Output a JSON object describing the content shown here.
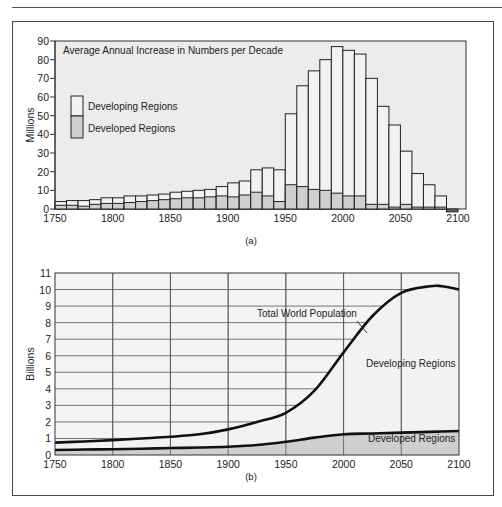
{
  "figure": {
    "panel_a_caption": "(a)",
    "panel_b_caption": "(b)"
  },
  "colors": {
    "plot_bg": "#ececec",
    "developing_fill": "#f2f2f2",
    "developed_fill": "#cfcfcf",
    "outline": "#222222",
    "grid": "#555555"
  },
  "chart_data": [
    {
      "type": "bar",
      "stacked": true,
      "title": "Average Annual Increase in Numbers per Decade",
      "xlabel": "",
      "ylabel": "Millions",
      "xlim": [
        1750,
        2100
      ],
      "ylim": [
        0,
        90
      ],
      "xticks": [
        1750,
        1800,
        1850,
        1900,
        1950,
        2000,
        2050,
        2100
      ],
      "yticks": [
        0,
        10,
        20,
        30,
        40,
        50,
        60,
        70,
        80,
        90
      ],
      "grid": false,
      "legend": {
        "position": "upper-left",
        "entries": [
          "Developing Regions",
          "Developed Regions"
        ]
      },
      "categories": [
        1750,
        1760,
        1770,
        1780,
        1790,
        1800,
        1810,
        1820,
        1830,
        1840,
        1850,
        1860,
        1870,
        1880,
        1890,
        1900,
        1910,
        1920,
        1930,
        1940,
        1950,
        1960,
        1970,
        1980,
        1990,
        2000,
        2010,
        2020,
        2030,
        2040,
        2050,
        2060,
        2070,
        2080,
        2090
      ],
      "series": [
        {
          "name": "Developed Regions",
          "values": [
            2,
            2,
            1.5,
            2.5,
            3,
            3,
            3.5,
            4,
            4.5,
            5,
            5.5,
            6,
            6,
            6.5,
            7,
            6.5,
            7.5,
            9,
            7,
            4,
            13,
            12,
            10.5,
            10,
            8.5,
            7,
            7,
            2.5,
            2.5,
            1,
            2.5,
            1,
            1,
            1,
            0
          ]
        },
        {
          "name": "Developing Regions",
          "values": [
            2,
            2.5,
            3,
            2.5,
            3,
            3,
            3.5,
            3,
            3,
            3,
            3.5,
            3.5,
            4,
            4,
            5,
            7.5,
            7.5,
            12,
            15,
            17,
            38,
            54,
            63.5,
            70,
            78.5,
            78,
            76,
            67.5,
            52.5,
            44,
            28.5,
            18,
            12,
            6,
            -1
          ]
        }
      ],
      "totals": [
        4,
        4.5,
        4.5,
        5,
        6,
        6,
        7,
        7,
        7.5,
        8,
        9,
        9.5,
        10,
        10.5,
        12,
        14,
        15,
        21,
        22,
        21,
        51,
        66,
        74,
        80,
        87,
        85,
        83,
        70,
        55,
        45,
        31,
        19,
        13,
        7,
        -1
      ]
    },
    {
      "type": "area",
      "stacked": true,
      "title": "",
      "xlabel": "",
      "ylabel": "Billions",
      "xlim": [
        1750,
        2100
      ],
      "ylim": [
        0,
        11
      ],
      "xticks": [
        1750,
        1800,
        1850,
        1900,
        1950,
        2000,
        2050,
        2100
      ],
      "yticks": [
        0,
        1,
        2,
        3,
        4,
        5,
        6,
        7,
        8,
        9,
        10,
        11
      ],
      "grid": true,
      "annotations": [
        "Total World Population",
        "Developing Regions",
        "Developed Regions"
      ],
      "x": [
        1750,
        1775,
        1800,
        1825,
        1850,
        1875,
        1900,
        1925,
        1950,
        1975,
        2000,
        2025,
        2050,
        2075,
        2085,
        2100
      ],
      "series": [
        {
          "name": "Developed Regions",
          "values": [
            0.3,
            0.33,
            0.35,
            0.38,
            0.42,
            0.45,
            0.5,
            0.6,
            0.8,
            1.05,
            1.25,
            1.3,
            1.35,
            1.4,
            1.42,
            1.45
          ]
        },
        {
          "name": "Total World Population",
          "values": [
            0.75,
            0.82,
            0.9,
            1.0,
            1.1,
            1.25,
            1.55,
            2.0,
            2.55,
            3.9,
            6.2,
            8.4,
            9.8,
            10.2,
            10.2,
            10.0
          ]
        }
      ]
    }
  ]
}
